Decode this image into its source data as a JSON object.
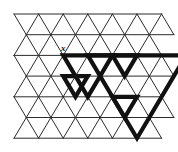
{
  "figure": {
    "type": "triangular-lattice-puzzle",
    "title": "",
    "canvas": {
      "width": 178,
      "height": 152,
      "background": "#ffffff"
    },
    "grid": {
      "origin_x": 14,
      "origin_y": 14,
      "rows": 6,
      "cols": 6,
      "row_height": 20.7,
      "half_width": 12.3,
      "line_color": "#2b2b2b",
      "line_width": 1.0,
      "description": "triangular lattice of upward and downward unit triangles"
    },
    "bold": {
      "color": "#111111",
      "line_width": 4.2,
      "join": "miter",
      "shapes": [
        {
          "name": "large-inverted-triangle",
          "orientation": "down",
          "size": 4,
          "apex_col": 5.0,
          "apex_row": 6
        },
        {
          "name": "medium-inverted-triangle",
          "orientation": "down",
          "size": 2,
          "apex_col": 3.0,
          "apex_row": 4
        },
        {
          "name": "small-inverted-triangle-upper",
          "orientation": "down",
          "size": 1,
          "apex_col": 4.5,
          "apex_row": 3
        },
        {
          "name": "small-inverted-triangle-mid",
          "orientation": "down",
          "size": 1,
          "apex_col": 2.5,
          "apex_row": 4
        },
        {
          "name": "small-inverted-triangle-lower",
          "orientation": "down",
          "size": 1,
          "apex_col": 4.5,
          "apex_row": 5
        }
      ]
    },
    "labels": [
      {
        "name": "point-label-x",
        "text": "x",
        "x": 61,
        "y": 44,
        "font_size": 9
      }
    ],
    "border": {
      "visible": false
    }
  }
}
